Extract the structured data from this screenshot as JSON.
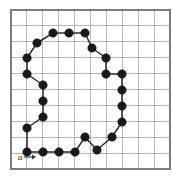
{
  "figure": {
    "caption_label": "a",
    "grid": {
      "columns": 10,
      "rows": 10,
      "cell_size": 15.9,
      "origin_x": 11,
      "origin_y": 10,
      "line_color": "#9a9a9a",
      "frame_color": "#7d7d7d",
      "background_color": "#ffffff",
      "show_grid": true
    },
    "chain": {
      "node_color": "#1a1a1a",
      "line_color": "#2b2b2b",
      "node_radius": 4.3,
      "closed": true,
      "node_count": 30,
      "start_index": 0,
      "points": [
        [
          27,
          152
        ],
        [
          43,
          152
        ],
        [
          59,
          152
        ],
        [
          75,
          152
        ],
        [
          85,
          137
        ],
        [
          97,
          150
        ],
        [
          112,
          137
        ],
        [
          122,
          122
        ],
        [
          122,
          106
        ],
        [
          122,
          90
        ],
        [
          122,
          74
        ],
        [
          106,
          74
        ],
        [
          106,
          58
        ],
        [
          92,
          48
        ],
        [
          85,
          33
        ],
        [
          69,
          33
        ],
        [
          53,
          33
        ],
        [
          37,
          43
        ],
        [
          27,
          58
        ],
        [
          27,
          74
        ],
        [
          43,
          85
        ],
        [
          43,
          101
        ],
        [
          43,
          117
        ],
        [
          27,
          128
        ]
      ]
    },
    "start_marker": {
      "label": "a",
      "label_x": 18,
      "label_y": 160,
      "arrow_from_x": 24,
      "arrow_from_y": 157,
      "arrow_to_x": 36,
      "arrow_to_y": 157,
      "direction": "right"
    }
  }
}
